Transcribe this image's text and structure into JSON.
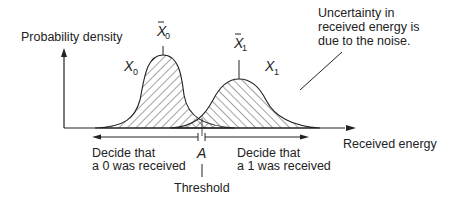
{
  "diagram": {
    "y_axis_label": "Probability density",
    "x_axis_label": "Received energy",
    "curve0": {
      "label": "X",
      "label_sub": "0",
      "mean_label": "X",
      "mean_sub": "0"
    },
    "curve1": {
      "label": "X",
      "label_sub": "1",
      "mean_label": "X",
      "mean_sub": "1"
    },
    "annotation": {
      "line1": "Uncertainty in",
      "line2": "received energy is",
      "line3": "due to the noise."
    },
    "decide0": {
      "line1": "Decide that",
      "line2": "a 0 was received"
    },
    "decide1": {
      "line1": "Decide that",
      "line2": "a 1 was received"
    },
    "threshold_symbol": "A",
    "threshold_label": "Threshold",
    "colors": {
      "ink": "#222222",
      "hatch": "#333333",
      "background": "#ffffff"
    }
  }
}
